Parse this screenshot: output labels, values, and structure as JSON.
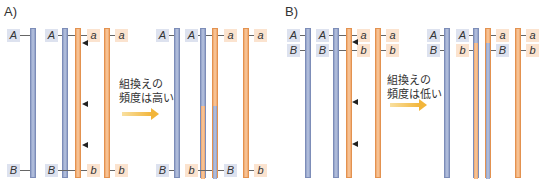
{
  "panels": [
    {
      "label": "A)",
      "caption_line1": "組換えの",
      "caption_line2": "頻度は高い",
      "before": {
        "top_labels": [
          "A",
          "A",
          "a",
          "a"
        ],
        "bottom_labels": [
          "B",
          "B",
          "b",
          "b"
        ]
      },
      "after": {
        "top_labels": [
          "A",
          "A",
          "a",
          "a"
        ],
        "bottom_labels": [
          "B",
          "b",
          "B",
          "b"
        ]
      }
    },
    {
      "label": "B)",
      "caption_line1": "組換えの",
      "caption_line2": "頻度は低い",
      "before": {
        "top_labels": [
          "A",
          "A",
          "a",
          "a"
        ],
        "bottom_labels": [
          "B",
          "B",
          "b",
          "b"
        ]
      },
      "after": {
        "top_labels": [
          "A",
          "A",
          "a",
          "a"
        ],
        "bottom_labels": [
          "B",
          "b",
          "B",
          "b"
        ]
      }
    }
  ],
  "colors": {
    "chromatid_blue": "#a3b1d6",
    "chromatid_orange": "#f4b684",
    "arrow": "#f2b53a"
  }
}
